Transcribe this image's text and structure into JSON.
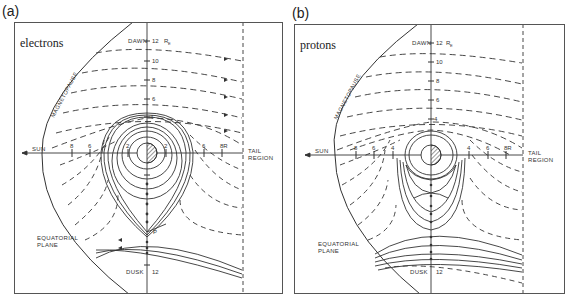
{
  "panels": [
    {
      "id": "a",
      "letter": "(a)",
      "species": "electrons",
      "frame": {
        "x": 14,
        "y": 22,
        "w": 269,
        "h": 272
      },
      "earth": {
        "cx": 147,
        "cy": 153,
        "r": 10
      },
      "tail_boundary_x": 243,
      "labels": {
        "dawn": "DAWN",
        "dawn_value": "12",
        "unit": "R",
        "unit_sub": "E",
        "dusk": "DUSK",
        "dusk_value": "12",
        "sun": "SUN",
        "tail_line1": "TAIL",
        "tail_line2": "REGION",
        "magnetopause": "MAGNETOPAUSE",
        "equatorial_line1": "EQUATORIAL",
        "equatorial_line2": "PLANE",
        "stagnation_point": "P"
      },
      "vertical_ticks": [
        "10",
        "8",
        "6",
        "4"
      ],
      "sunward_ticks": [
        "8",
        "6",
        "2"
      ],
      "tailward_ticks": [
        "2",
        "6",
        "8R"
      ]
    },
    {
      "id": "b",
      "letter": "(b)",
      "species": "protons",
      "frame": {
        "x": 294,
        "y": 24,
        "w": 271,
        "h": 270
      },
      "earth": {
        "cx": 431,
        "cy": 155,
        "r": 10
      },
      "tail_boundary_x": 523,
      "labels": {
        "dawn": "DAWN",
        "dawn_value": "12",
        "unit": "R",
        "unit_sub": "E",
        "dusk": "DUSK",
        "dusk_value": "12",
        "sun": "SUN",
        "tail_line1": "TAIL",
        "tail_line2": "REGION",
        "magnetopause": "MAGNETOPAUSE",
        "equatorial_line1": "EQUATORIAL",
        "equatorial_line2": "PLANE"
      },
      "vertical_ticks": [
        "10",
        "8",
        "6",
        "4"
      ],
      "sunward_ticks": [
        "8",
        "6",
        "4"
      ],
      "tailward_ticks": [
        "4",
        "6",
        "8R"
      ]
    }
  ],
  "scale_px_per_re": 9.4,
  "colors": {
    "line": "#333333",
    "frame": "#555555",
    "background": "#ffffff"
  }
}
